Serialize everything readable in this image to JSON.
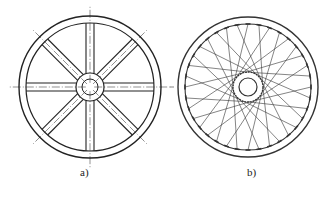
{
  "figure": {
    "panels": [
      {
        "id": "a",
        "label": "a)",
        "description": "Wheel with 8 straight spokes (flat bars) and centerlines",
        "center": [
          90,
          87
        ],
        "rim_outer_radius": 71,
        "rim_inner_radius": 64,
        "hub_outer_radius": 14,
        "hub_inner_radius": 8,
        "spoke_count": 8,
        "spoke_half_width": 4,
        "stroke_color": "#222222"
      },
      {
        "id": "b",
        "label": "b)",
        "description": "Wire-spoke wheel with crossed tangential spokes and nipples on rim",
        "center": [
          248,
          87
        ],
        "rim_outer_radius": 70,
        "rim_inner_radius": 63,
        "hub_outer_radius": 15,
        "hub_inner_radius": 9,
        "spoke_count": 36,
        "stroke_color": "#333333"
      }
    ]
  }
}
